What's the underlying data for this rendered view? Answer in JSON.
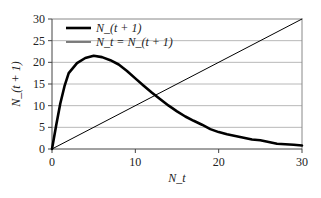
{
  "chart_data": {
    "type": "line",
    "title": "",
    "xlabel": "N_t",
    "ylabel": "N_(t + 1)",
    "xlim": [
      0,
      30
    ],
    "ylim": [
      0,
      30
    ],
    "x_ticks": [
      0,
      10,
      20,
      30
    ],
    "y_ticks": [
      0,
      5,
      10,
      15,
      20,
      25,
      30
    ],
    "x_tick_labels": [
      "0",
      "10",
      "20",
      "30"
    ],
    "y_tick_labels": [
      "0",
      "5",
      "10",
      "15",
      "20",
      "25",
      "30"
    ],
    "grid": "horizontal",
    "legend_position": "top-left",
    "series": [
      {
        "name": "N_(t + 1)",
        "style": "thick",
        "color": "#000000",
        "x": [
          0,
          0.5,
          1,
          1.5,
          2,
          3,
          4,
          5,
          6,
          7,
          8,
          9,
          10,
          11,
          12,
          13,
          14,
          15,
          16,
          17,
          18,
          19,
          20,
          21,
          22,
          23,
          24,
          25,
          26,
          27,
          28,
          29,
          30
        ],
        "y": [
          0,
          5.5,
          10.5,
          14.5,
          17.5,
          19.8,
          21.0,
          21.5,
          21.2,
          20.5,
          19.5,
          18.0,
          16.3,
          14.6,
          13.0,
          11.5,
          10.0,
          8.7,
          7.5,
          6.5,
          5.6,
          4.6,
          3.9,
          3.4,
          3.0,
          2.6,
          2.2,
          2.0,
          1.6,
          1.2,
          1.1,
          1.0,
          0.8
        ]
      },
      {
        "name": "N_t = N_(t + 1)",
        "style": "thin",
        "color": "#000000",
        "x": [
          0,
          30
        ],
        "y": [
          0,
          30
        ]
      }
    ]
  }
}
